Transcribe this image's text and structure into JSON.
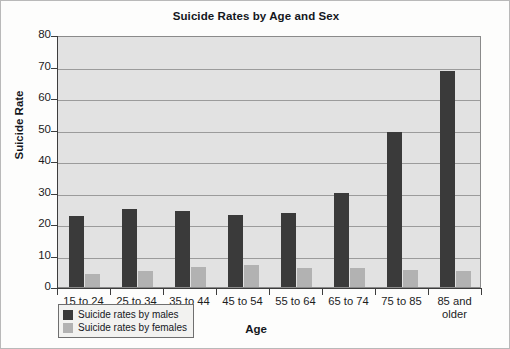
{
  "chart_data": {
    "type": "bar",
    "title": "Suicide Rates by Age and Sex",
    "xlabel": "Age",
    "ylabel": "Suicide Rate",
    "ylim": [
      0,
      80
    ],
    "ytick_step": 10,
    "yticks": [
      "80",
      "70",
      "60",
      "50",
      "40",
      "30",
      "20",
      "10",
      "0"
    ],
    "grid": true,
    "legend_position": "bottom-left",
    "categories": [
      "15 to 24",
      "25 to 34",
      "35 to 44",
      "45 to 54",
      "55 to 64",
      "65 to 74",
      "75 to 85",
      "85 and older"
    ],
    "series": [
      {
        "name": "Suicide rates by males",
        "color": "#3a3a3a",
        "values": [
          22.5,
          24.7,
          24.1,
          22.8,
          23.6,
          29.8,
          49.2,
          68.5
        ]
      },
      {
        "name": "Suicide rates by females",
        "color": "#b2b2b2",
        "values": [
          4.2,
          5.1,
          6.2,
          7.0,
          6.1,
          5.9,
          5.5,
          5.0
        ]
      }
    ]
  },
  "colors": {
    "male": "#3a3a3a",
    "female": "#b2b2b2",
    "plot_background": "#e2e2e2",
    "gridline": "#9b9b9b",
    "axis": "#3d3d3d"
  }
}
